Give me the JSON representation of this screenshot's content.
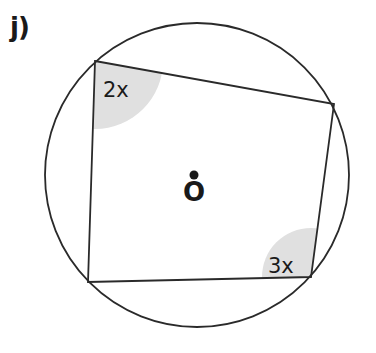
{
  "question_label": "j)",
  "diagram": {
    "circle": {
      "cx": 197,
      "cy": 175,
      "r": 152
    },
    "quadrilateral": {
      "vertices": [
        [
          95,
          61
        ],
        [
          334,
          104
        ],
        [
          311,
          277
        ],
        [
          88,
          282
        ]
      ]
    },
    "angles": [
      {
        "label": "2x",
        "vertex": [
          95,
          61
        ],
        "shade_center": [
          113,
          86
        ],
        "shade_r": 50
      },
      {
        "label": "3x",
        "vertex": [
          311,
          277
        ],
        "shade_center": [
          290,
          262
        ],
        "shade_r": 34
      }
    ],
    "center": {
      "label": "O",
      "dot": [
        194,
        174
      ]
    },
    "colors": {
      "stroke": "#2a2a2a",
      "shade": "#e0e0e0",
      "text": "#1a1a1a"
    }
  }
}
